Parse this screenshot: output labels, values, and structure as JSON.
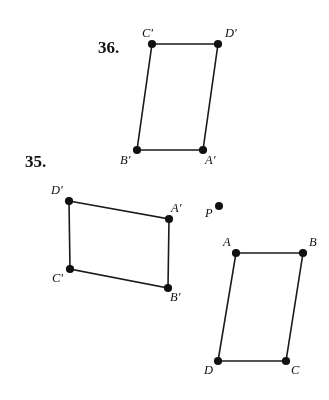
{
  "page": {
    "width": 329,
    "height": 400,
    "background_color": "#ffffff",
    "ink_color": "#111111",
    "grid": {
      "left": 17,
      "top": 21,
      "width": 301,
      "height": 364,
      "minor_spacing_px": 6.7,
      "major_spacing_px": 33.5,
      "minor_color": "#a5a5b4",
      "major_color": "#9696a5",
      "style": "dotted-graph-paper"
    }
  },
  "problems": [
    {
      "id": "36",
      "label": "36.",
      "x": 98,
      "y": 38
    },
    {
      "id": "35",
      "label": "35.",
      "x": 25,
      "y": 152
    }
  ],
  "figures": [
    {
      "id": "figure-36-image",
      "problem": "36",
      "name": "parallelogram-A-prime-B-prime-C-prime-D-prime",
      "closed": true,
      "vertices": [
        {
          "label": "C'",
          "x": 152,
          "y": 44,
          "label_x": 142,
          "label_y": 27,
          "label_anchor": "above-left"
        },
        {
          "label": "D'",
          "x": 218,
          "y": 44,
          "label_x": 225,
          "label_y": 27,
          "label_anchor": "above-right"
        },
        {
          "label": "A'",
          "x": 203,
          "y": 150,
          "label_x": 205,
          "label_y": 154,
          "label_anchor": "below-right"
        },
        {
          "label": "B'",
          "x": 137,
          "y": 150,
          "label_x": 120,
          "label_y": 154,
          "label_anchor": "below-left"
        }
      ]
    },
    {
      "id": "figure-35-image",
      "problem": "35",
      "name": "quadrilateral-A-prime-B-prime-C-prime-D-prime",
      "closed": true,
      "vertices": [
        {
          "label": "D'",
          "x": 69,
          "y": 201,
          "label_x": 51,
          "label_y": 184,
          "label_anchor": "above-left"
        },
        {
          "label": "A'",
          "x": 169,
          "y": 219,
          "label_x": 171,
          "label_y": 202,
          "label_anchor": "above-right"
        },
        {
          "label": "B'",
          "x": 168,
          "y": 288,
          "label_x": 170,
          "label_y": 291,
          "label_anchor": "below-right"
        },
        {
          "label": "C'",
          "x": 70,
          "y": 269,
          "label_x": 52,
          "label_y": 272,
          "label_anchor": "below-left"
        }
      ]
    },
    {
      "id": "figure-35-preimage",
      "problem": "35",
      "name": "parallelogram-A-B-C-D",
      "closed": true,
      "vertices": [
        {
          "label": "A",
          "x": 236,
          "y": 253,
          "label_x": 223,
          "label_y": 236,
          "label_anchor": "above-left"
        },
        {
          "label": "B",
          "x": 303,
          "y": 253,
          "label_x": 309,
          "label_y": 236,
          "label_anchor": "above-right"
        },
        {
          "label": "C",
          "x": 286,
          "y": 361,
          "label_x": 291,
          "label_y": 364,
          "label_anchor": "below-right"
        },
        {
          "label": "D",
          "x": 218,
          "y": 361,
          "label_x": 204,
          "label_y": 364,
          "label_anchor": "below-left"
        }
      ]
    }
  ],
  "points": [
    {
      "id": "center-of-dilation",
      "label": "P",
      "x": 219,
      "y": 206,
      "label_x": 205,
      "label_y": 207,
      "radius": 4
    }
  ],
  "vertex_dot_radius": 4.1
}
